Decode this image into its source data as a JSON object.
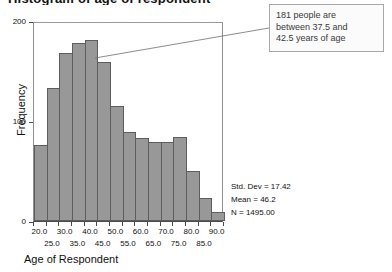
{
  "title_strip": "Histogram of age of respondent",
  "chart_data": {
    "type": "bar",
    "title": "",
    "xlabel": "Age of Respondent",
    "ylabel": "Frequency",
    "ylim": [
      0,
      200
    ],
    "xlim": [
      17.5,
      92.5
    ],
    "grid": false,
    "legend": "none",
    "bin_width": 5,
    "categories": [
      "20.0",
      "25.0",
      "30.0",
      "35.0",
      "40.0",
      "45.0",
      "50.0",
      "55.0",
      "60.0",
      "65.0",
      "70.0",
      "75.0",
      "80.0",
      "85.0",
      "90.0"
    ],
    "bin_centers": [
      20,
      25,
      30,
      35,
      40,
      45,
      50,
      55,
      60,
      65,
      70,
      75,
      80,
      85,
      90
    ],
    "values": [
      76,
      133,
      168,
      178,
      181,
      159,
      115,
      89,
      83,
      79,
      79,
      84,
      50,
      23,
      9
    ],
    "ytick_values": [
      0,
      100,
      200
    ],
    "ytick_labels": [
      "0",
      "100",
      "200"
    ],
    "xtick_labels_row1": [
      "20.0",
      "30.0",
      "40.0",
      "50.0",
      "60.0",
      "70.0",
      "80.0",
      "90.0"
    ],
    "xtick_labels_row2": [
      "25.0",
      "35.0",
      "45.0",
      "55.0",
      "65.0",
      "75.0",
      "85.0"
    ],
    "annotations": [
      {
        "name": "bin-callout",
        "text": "181 people are between 37.5 and 42.5 years of age",
        "target_bin_center": 40,
        "target_value": 181
      }
    ],
    "statistics": [
      "Std. Dev = 17.42",
      "Mean = 46.2",
      "N = 1495.00"
    ],
    "colors": {
      "bar_fill": "#989898",
      "bar_border": "#5d5d5d",
      "axis": "#4a4a4a",
      "callout_border": "#a8a8a8",
      "callout_background": "#fbfbfb"
    }
  },
  "callout": {
    "line1": "181 people are",
    "line2": "between 37.5 and",
    "line3": "42.5 years of age"
  },
  "stats": {
    "std_dev": "Std. Dev = 17.42",
    "mean": "Mean = 46.2",
    "n": "N = 1495.00"
  },
  "axes": {
    "y_title": "Frequency",
    "x_title": "Age of Respondent"
  }
}
